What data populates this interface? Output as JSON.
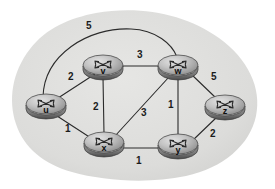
{
  "figure": {
    "background_color": "#ffffff",
    "cloud_color": "#dededc",
    "edge_color": "#2b2b2b",
    "node_body_color": "#9a9a9a",
    "node_top_color": "#c9c9c9",
    "label_color": "#1b1b1b"
  },
  "graph": {
    "nodes": [
      {
        "id": "u",
        "label": "u",
        "x": 46,
        "y": 106
      },
      {
        "id": "v",
        "label": "v",
        "x": 103,
        "y": 67
      },
      {
        "id": "w",
        "label": "w",
        "x": 178,
        "y": 67
      },
      {
        "id": "x",
        "label": "x",
        "x": 104,
        "y": 144
      },
      {
        "id": "y",
        "label": "y",
        "x": 178,
        "y": 146
      },
      {
        "id": "z",
        "label": "z",
        "x": 225,
        "y": 107
      }
    ],
    "edges": [
      {
        "from": "u",
        "to": "w",
        "weight": "5",
        "shape": "curved",
        "label_x": 86,
        "label_y": 29
      },
      {
        "from": "u",
        "to": "v",
        "weight": "2",
        "shape": "straight",
        "label_x": 68,
        "label_y": 80
      },
      {
        "from": "u",
        "to": "x",
        "weight": "1",
        "shape": "straight",
        "label_x": 65,
        "label_y": 132
      },
      {
        "from": "v",
        "to": "w",
        "weight": "3",
        "shape": "straight",
        "label_x": 137,
        "label_y": 58
      },
      {
        "from": "v",
        "to": "x",
        "weight": "2",
        "shape": "straight",
        "label_x": 97,
        "label_y": 107
      },
      {
        "from": "x",
        "to": "w",
        "weight": "3",
        "shape": "straight",
        "label_x": 141,
        "label_y": 116
      },
      {
        "from": "x",
        "to": "y",
        "weight": "1",
        "shape": "straight",
        "label_x": 136,
        "label_y": 162
      },
      {
        "from": "w",
        "to": "y",
        "weight": "1",
        "shape": "straight",
        "label_x": 170,
        "label_y": 107
      },
      {
        "from": "w",
        "to": "z",
        "weight": "5",
        "shape": "straight",
        "label_x": 212,
        "label_y": 79
      },
      {
        "from": "y",
        "to": "z",
        "weight": "2",
        "shape": "straight",
        "label_x": 211,
        "label_y": 136
      }
    ]
  }
}
